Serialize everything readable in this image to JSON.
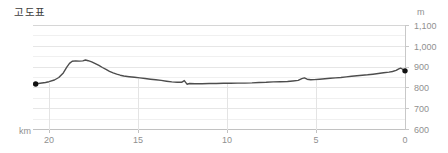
{
  "title": "고도표",
  "chart_data": {
    "type": "line",
    "title": "고도표",
    "x_unit": "km",
    "y_unit": "m",
    "x_axis": {
      "reversed": true,
      "min": 0,
      "max": 20.9,
      "ticks": [
        20,
        15,
        10,
        5,
        0
      ],
      "tick_labels": [
        "20",
        "15",
        "10",
        "5",
        "0"
      ]
    },
    "y_axis": {
      "min": 600,
      "max": 1100,
      "ticks": [
        1100,
        1000,
        900,
        800,
        700,
        600
      ],
      "tick_labels": [
        "1,100",
        "1,000",
        "900",
        "800",
        "700",
        "600"
      ],
      "minor_step": 50
    },
    "grid": true,
    "legend": false,
    "endpoint_dots": true,
    "series": [
      {
        "name": "elevation-profile",
        "points": [
          [
            20.75,
            819
          ],
          [
            20.5,
            822
          ],
          [
            20.2,
            826
          ],
          [
            20,
            830
          ],
          [
            19.7,
            838
          ],
          [
            19.45,
            850
          ],
          [
            19.2,
            872
          ],
          [
            19,
            900
          ],
          [
            18.85,
            918
          ],
          [
            18.7,
            928
          ],
          [
            18.5,
            930
          ],
          [
            18.3,
            929
          ],
          [
            18.1,
            930
          ],
          [
            17.95,
            934
          ],
          [
            17.8,
            931
          ],
          [
            17.6,
            925
          ],
          [
            17.4,
            917
          ],
          [
            17.2,
            908
          ],
          [
            17,
            898
          ],
          [
            16.8,
            889
          ],
          [
            16.6,
            880
          ],
          [
            16.4,
            872
          ],
          [
            16.2,
            866
          ],
          [
            16,
            861
          ],
          [
            15.8,
            857
          ],
          [
            15.5,
            854
          ],
          [
            15.2,
            851
          ],
          [
            14.9,
            848
          ],
          [
            14.6,
            845
          ],
          [
            14.3,
            842
          ],
          [
            14,
            839
          ],
          [
            13.7,
            836
          ],
          [
            13.4,
            832
          ],
          [
            13.1,
            829
          ],
          [
            12.8,
            827
          ],
          [
            12.55,
            827
          ],
          [
            12.4,
            835
          ],
          [
            12.25,
            818
          ],
          [
            12.1,
            821
          ],
          [
            11.8,
            820
          ],
          [
            11.4,
            820
          ],
          [
            11,
            821
          ],
          [
            10.6,
            821
          ],
          [
            10.2,
            822
          ],
          [
            9.8,
            822
          ],
          [
            9.4,
            823
          ],
          [
            9,
            823
          ],
          [
            8.6,
            824
          ],
          [
            8.2,
            826
          ],
          [
            7.8,
            827
          ],
          [
            7.4,
            829
          ],
          [
            7,
            830
          ],
          [
            6.6,
            831
          ],
          [
            6.3,
            833
          ],
          [
            6,
            836
          ],
          [
            5.8,
            844
          ],
          [
            5.65,
            848
          ],
          [
            5.5,
            842
          ],
          [
            5.3,
            839
          ],
          [
            5.1,
            840
          ],
          [
            4.8,
            842
          ],
          [
            4.5,
            844
          ],
          [
            4.2,
            846
          ],
          [
            3.9,
            848
          ],
          [
            3.6,
            850
          ],
          [
            3.3,
            853
          ],
          [
            3,
            856
          ],
          [
            2.7,
            858
          ],
          [
            2.4,
            861
          ],
          [
            2.1,
            863
          ],
          [
            1.8,
            866
          ],
          [
            1.5,
            869
          ],
          [
            1.2,
            873
          ],
          [
            0.9,
            876
          ],
          [
            0.7,
            879
          ],
          [
            0.5,
            884
          ],
          [
            0.35,
            892
          ],
          [
            0.25,
            895
          ],
          [
            0.15,
            891
          ],
          [
            0.05,
            885
          ],
          [
            0,
            882
          ]
        ]
      }
    ]
  },
  "colors": {
    "line": "#4d4d4d",
    "dot": "#111111",
    "tick_label": "#909090",
    "title": "#3c3c3c",
    "grid_minor": "#f0f0f0",
    "grid_major": "#e6e6e6",
    "top_border": "#d6d6d6",
    "bottom_axis": "#c2c2c2",
    "right_axis": "#c8c8c8",
    "dropline": "#e4e4e4"
  }
}
